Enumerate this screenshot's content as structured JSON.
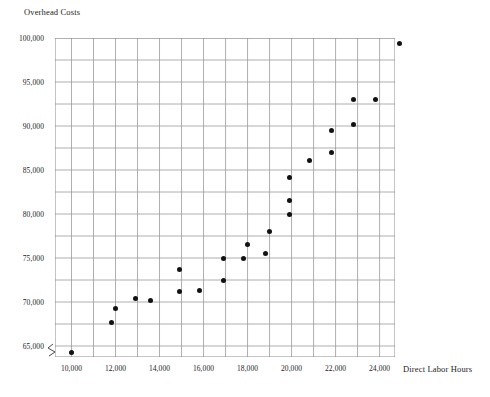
{
  "chart": {
    "title": "Overhead Costs",
    "x_axis_title": "Direct Labor Hours",
    "axis_break_marker": "axis-break-zigzag"
  },
  "y_ticks": [
    {
      "label": "100,000",
      "value": 100000
    },
    {
      "label": "95,000",
      "value": 95000
    },
    {
      "label": "90,000",
      "value": 90000
    },
    {
      "label": "85,000",
      "value": 85000
    },
    {
      "label": "80,000",
      "value": 80000
    },
    {
      "label": "75,000",
      "value": 75000
    },
    {
      "label": "70,000",
      "value": 70000
    },
    {
      "label": "65,000",
      "value": 65000
    }
  ],
  "x_ticks": [
    {
      "label": "10,000",
      "value": 10000
    },
    {
      "label": "12,000",
      "value": 12000
    },
    {
      "label": "14,000",
      "value": 14000
    },
    {
      "label": "16,000",
      "value": 16000
    },
    {
      "label": "18,000",
      "value": 18000
    },
    {
      "label": "20,000",
      "value": 20000
    },
    {
      "label": "22,000",
      "value": 22000
    },
    {
      "label": "24,000",
      "value": 24000
    }
  ],
  "chart_data": {
    "type": "scatter",
    "title": "Overhead Costs",
    "xlabel": "Direct Labor Hours",
    "ylabel": "Overhead Costs",
    "xlim": [
      9250,
      24700
    ],
    "ylim": [
      63750,
      100000
    ],
    "xtick_step": 2000,
    "ytick_step": 5000,
    "x_minor_step": 1000,
    "y_minor_step": 2500,
    "grid": true,
    "legend": null,
    "point_color": "#121212",
    "points": [
      {
        "x": 10000,
        "y": 64300
      },
      {
        "x": 11800,
        "y": 67700
      },
      {
        "x": 12000,
        "y": 69300
      },
      {
        "x": 12900,
        "y": 70400
      },
      {
        "x": 13600,
        "y": 70200
      },
      {
        "x": 14900,
        "y": 73700
      },
      {
        "x": 14900,
        "y": 71200
      },
      {
        "x": 15800,
        "y": 71300
      },
      {
        "x": 16900,
        "y": 72500
      },
      {
        "x": 16900,
        "y": 75000
      },
      {
        "x": 17800,
        "y": 75000
      },
      {
        "x": 18000,
        "y": 76500
      },
      {
        "x": 18800,
        "y": 75500
      },
      {
        "x": 19000,
        "y": 78000
      },
      {
        "x": 19900,
        "y": 84200
      },
      {
        "x": 19900,
        "y": 81500
      },
      {
        "x": 19900,
        "y": 80000
      },
      {
        "x": 20800,
        "y": 86100
      },
      {
        "x": 21800,
        "y": 87000
      },
      {
        "x": 21800,
        "y": 89500
      },
      {
        "x": 22800,
        "y": 93000
      },
      {
        "x": 22800,
        "y": 90200
      },
      {
        "x": 23800,
        "y": 93000
      },
      {
        "x": 24900,
        "y": 99400
      }
    ]
  }
}
